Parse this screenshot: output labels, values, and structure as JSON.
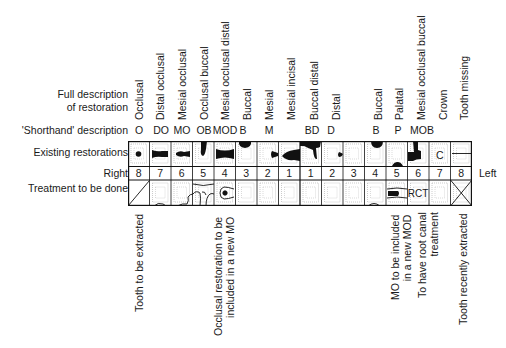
{
  "row_labels": {
    "full_description_line1": "Full description",
    "full_description_line2": "of restoration",
    "shorthand": "'Shorthand' description",
    "existing": "Existing restorations",
    "right": "Right",
    "left": "Left",
    "treatment": "Treatment to be done"
  },
  "columns": [
    {
      "full": "Occlusal",
      "short": "O",
      "number": "8"
    },
    {
      "full": "Distal occlusal",
      "short": "DO",
      "number": "7"
    },
    {
      "full": "Mesial occlusal",
      "short": "MO",
      "number": "6"
    },
    {
      "full": "Occlusal buccal",
      "short": "OB",
      "number": "5"
    },
    {
      "full": "Mesial occlusal distal",
      "short": "MOD",
      "number": "4"
    },
    {
      "full": "Buccal",
      "short": "B",
      "number": "3"
    },
    {
      "full": "Mesial",
      "short": "M",
      "number": "2"
    },
    {
      "full": "Mesial incisal",
      "short": "",
      "number": "1"
    },
    {
      "full": "Buccal distal",
      "short": "BD",
      "number": "1"
    },
    {
      "full": "Distal",
      "short": "D",
      "number": "2"
    },
    {
      "full": "",
      "short": "",
      "number": "3"
    },
    {
      "full": "Buccal",
      "short": "B",
      "number": "4"
    },
    {
      "full": "Palatal",
      "short": "P",
      "number": "5"
    },
    {
      "full": "Mesial occlusal buccal",
      "short": "MOB",
      "number": "6"
    },
    {
      "full": "Crown",
      "short": "",
      "number": "7"
    },
    {
      "full": "Tooth missing",
      "short": "",
      "number": "8"
    }
  ],
  "cell_marks": {
    "crown": "C",
    "rct": "RCT"
  },
  "treatment_notes": [
    {
      "col": 0,
      "lines": [
        "Tooth to be extracted"
      ]
    },
    {
      "col": 4,
      "lines": [
        "Occlusal restoration to be",
        "included in a new MO"
      ]
    },
    {
      "col": 12,
      "lines": [
        "MO to be included",
        "in a new MOD"
      ]
    },
    {
      "col": 13,
      "lines": [
        "To have root canal",
        "treatment"
      ]
    },
    {
      "col": 15,
      "lines": [
        "Tooth recently extracted"
      ]
    }
  ],
  "colors": {
    "ink": "#1a1a1a",
    "dotted": "#9a9a9a"
  }
}
